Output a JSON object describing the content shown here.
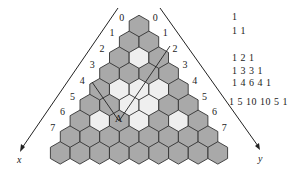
{
  "diagram": {
    "type": "hexagonal-pascal-triangle",
    "rows": 9,
    "colors": {
      "filled": "#a9a9a9",
      "empty": "#efefef",
      "stroke": "#333333",
      "line": "#222222"
    },
    "white_cells": {
      "2": [
        1
      ],
      "4": [
        1,
        2,
        3
      ],
      "5": [
        2,
        3
      ],
      "6": [
        1,
        3,
        5
      ]
    },
    "left_labels": [
      "0",
      "1",
      "2",
      "3",
      "4",
      "5",
      "6",
      "7"
    ],
    "right_labels": [
      "0",
      "1",
      "2",
      "3",
      "4",
      "5",
      "6",
      "7"
    ],
    "axes": {
      "x": "x",
      "y": "y"
    },
    "point_label": "A"
  },
  "pascal": {
    "rows": [
      "1",
      "1 1",
      "1 2 1",
      "1 3 3 1",
      "1 4 6 4 1",
      "1 5 10 10 5 1"
    ]
  }
}
